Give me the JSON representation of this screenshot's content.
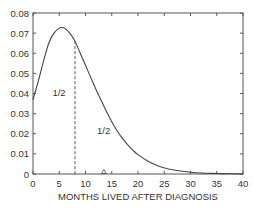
{
  "chart_data": {
    "type": "line",
    "title": "",
    "xlabel": "MONTHS LIVED AFTER DIAGNOSIS",
    "ylabel": "",
    "xlim": [
      0,
      40
    ],
    "ylim": [
      0,
      0.08
    ],
    "x_ticks": [
      "0",
      "5",
      "10",
      "15",
      "20",
      "25",
      "30",
      "35",
      "40"
    ],
    "y_ticks": [
      "0",
      "0.01",
      "0.02",
      "0.03",
      "0.04",
      "0.05",
      "0.06",
      "0.07",
      "0.08"
    ],
    "grid": false,
    "series": [
      {
        "name": "survival density",
        "x": [
          0,
          1,
          2,
          3,
          4,
          5,
          5.5,
          6,
          7,
          8,
          9,
          10,
          11,
          12,
          13,
          14,
          15,
          16,
          17,
          18,
          19,
          20,
          22,
          24,
          26,
          28,
          30,
          32,
          34,
          36,
          38,
          40
        ],
        "values": [
          0.037,
          0.046,
          0.056,
          0.065,
          0.07,
          0.0725,
          0.0728,
          0.0725,
          0.07,
          0.066,
          0.06,
          0.054,
          0.048,
          0.042,
          0.0365,
          0.031,
          0.026,
          0.0215,
          0.0178,
          0.0146,
          0.0119,
          0.0096,
          0.0062,
          0.0039,
          0.0024,
          0.0015,
          0.0009,
          0.0005,
          0.0003,
          0.0002,
          0.0001,
          0.0
        ]
      }
    ],
    "annotations": [
      {
        "type": "vline",
        "style": "dashed",
        "x": 8,
        "label": "median"
      },
      {
        "type": "text",
        "text": "1/2",
        "x": 3.7,
        "y": 0.039
      },
      {
        "type": "text",
        "text": "1/2",
        "x": 12.2,
        "y": 0.02
      },
      {
        "type": "marker",
        "shape": "triangle-open",
        "x": 13.5,
        "y": 0,
        "label": "mean"
      }
    ]
  },
  "labels": {
    "left_half": "1/2",
    "right_half": "1/2",
    "xlabel": "MONTHS LIVED AFTER DIAGNOSIS"
  }
}
